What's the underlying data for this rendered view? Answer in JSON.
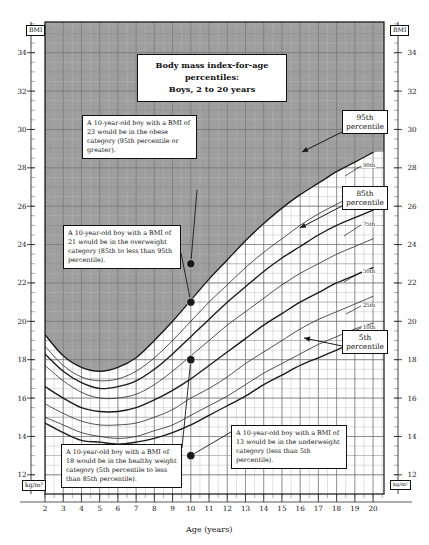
{
  "title": {
    "line1": "Body mass index-for-age percentiles:",
    "line2": "Boys, 2 to 20 years"
  },
  "axes": {
    "y_unit_top": "BMI",
    "y_unit_bottom": "kg/m²",
    "x_title": "Age (years)",
    "y_ticks": [
      "34",
      "32",
      "30",
      "28",
      "26",
      "24",
      "22",
      "20",
      "18",
      "16",
      "14",
      "12"
    ],
    "x_ticks": [
      "2",
      "3",
      "4",
      "5",
      "6",
      "7",
      "8",
      "9",
      "10",
      "11",
      "12",
      "13",
      "14",
      "15",
      "16",
      "17",
      "18",
      "19",
      "20"
    ],
    "x_min": 2,
    "x_max": 20.6,
    "y_min": 11,
    "y_max": 35.6
  },
  "percentile_labels": {
    "p95_line1": "95th",
    "p95_line2": "percentile",
    "p85_line1": "85th",
    "p85_line2": "percentile",
    "p5_line1": "5th",
    "p5_line2": "percentile",
    "p90": "90th",
    "p75": "75th",
    "p50": "50th",
    "p25": "25th",
    "p10": "10th"
  },
  "callouts": {
    "obese": "A 10-year-old boy with a BMI of 23 would be in the obese category (95th percentile or greater).",
    "overweight": "A 10-year-old boy with a BMI of 21 would be in the overweight category (85th to less than 95th percentile).",
    "healthy": "A 10-year-old boy with a BMI of 18 would be in the healthy weight category (5th percentile to less than 85th percentile).",
    "underweight": "A 10-year-old boy with a BMI of 13 would be in the underweight category (less than 5th percentile)."
  },
  "colors": {
    "shaded_region": "#999999",
    "grid_minor": "#b9b9b9",
    "grid_major": "#6a6a6a",
    "curve": "#1a1a1a",
    "frame": "#111111",
    "background": "#ffffff"
  },
  "chart_data": {
    "type": "line",
    "title": "Body mass index-for-age percentiles: Boys, 2 to 20 years",
    "xlabel": "Age (years)",
    "ylabel": "BMI (kg/m²)",
    "xlim": [
      2,
      20.6
    ],
    "ylim": [
      11,
      35.6
    ],
    "grid": true,
    "legend_position": "inline-right",
    "shaded_region_note": "gray shading marks BMI at or above the 95th percentile (obese category)",
    "x": [
      2,
      3,
      4,
      5,
      6,
      7,
      8,
      9,
      10,
      11,
      12,
      13,
      14,
      15,
      16,
      17,
      18,
      19,
      20
    ],
    "series": [
      {
        "name": "95th percentile",
        "emphasis": "bold",
        "values": [
          19.3,
          18.2,
          17.6,
          17.4,
          17.6,
          18.1,
          19.0,
          20.0,
          21.1,
          22.2,
          23.2,
          24.2,
          25.1,
          25.9,
          26.6,
          27.2,
          27.8,
          28.3,
          28.8
        ]
      },
      {
        "name": "90th percentile",
        "emphasis": "thin",
        "values": [
          18.7,
          17.7,
          17.1,
          16.9,
          17.0,
          17.4,
          18.1,
          19.0,
          20.0,
          21.0,
          21.9,
          22.8,
          23.6,
          24.3,
          25.0,
          25.6,
          26.1,
          26.6,
          27.0
        ]
      },
      {
        "name": "85th percentile",
        "emphasis": "bold",
        "values": [
          18.3,
          17.4,
          16.8,
          16.5,
          16.6,
          16.9,
          17.5,
          18.3,
          19.2,
          20.1,
          21.0,
          21.8,
          22.6,
          23.3,
          23.9,
          24.5,
          25.0,
          25.4,
          25.8
        ]
      },
      {
        "name": "75th percentile",
        "emphasis": "thin",
        "values": [
          17.7,
          16.9,
          16.3,
          16.0,
          16.0,
          16.2,
          16.7,
          17.4,
          18.2,
          19.0,
          19.8,
          20.5,
          21.2,
          21.9,
          22.5,
          23.0,
          23.5,
          23.9,
          24.3
        ]
      },
      {
        "name": "50th percentile",
        "emphasis": "bold",
        "values": [
          16.6,
          16.0,
          15.5,
          15.3,
          15.3,
          15.5,
          15.9,
          16.4,
          17.0,
          17.7,
          18.4,
          19.1,
          19.8,
          20.4,
          21.0,
          21.5,
          22.0,
          22.4,
          22.8
        ]
      },
      {
        "name": "25th percentile",
        "emphasis": "thin",
        "values": [
          15.7,
          15.2,
          14.8,
          14.6,
          14.6,
          14.7,
          15.0,
          15.4,
          16.0,
          16.5,
          17.1,
          17.8,
          18.4,
          19.0,
          19.6,
          20.1,
          20.5,
          20.9,
          21.3
        ]
      },
      {
        "name": "10th percentile",
        "emphasis": "thin",
        "values": [
          15.0,
          14.6,
          14.2,
          14.0,
          13.9,
          14.0,
          14.3,
          14.6,
          15.1,
          15.6,
          16.1,
          16.7,
          17.3,
          17.8,
          18.3,
          18.8,
          19.2,
          19.6,
          19.9
        ]
      },
      {
        "name": "5th percentile",
        "emphasis": "bold",
        "values": [
          14.7,
          14.2,
          13.8,
          13.7,
          13.6,
          13.7,
          13.9,
          14.2,
          14.6,
          15.1,
          15.6,
          16.1,
          16.7,
          17.2,
          17.7,
          18.1,
          18.5,
          18.9,
          19.2
        ]
      }
    ],
    "points": [
      {
        "label": "obese example",
        "age": 10,
        "bmi": 23
      },
      {
        "label": "overweight example",
        "age": 10,
        "bmi": 21
      },
      {
        "label": "healthy weight example",
        "age": 10,
        "bmi": 18
      },
      {
        "label": "underweight example",
        "age": 10,
        "bmi": 13
      }
    ]
  }
}
